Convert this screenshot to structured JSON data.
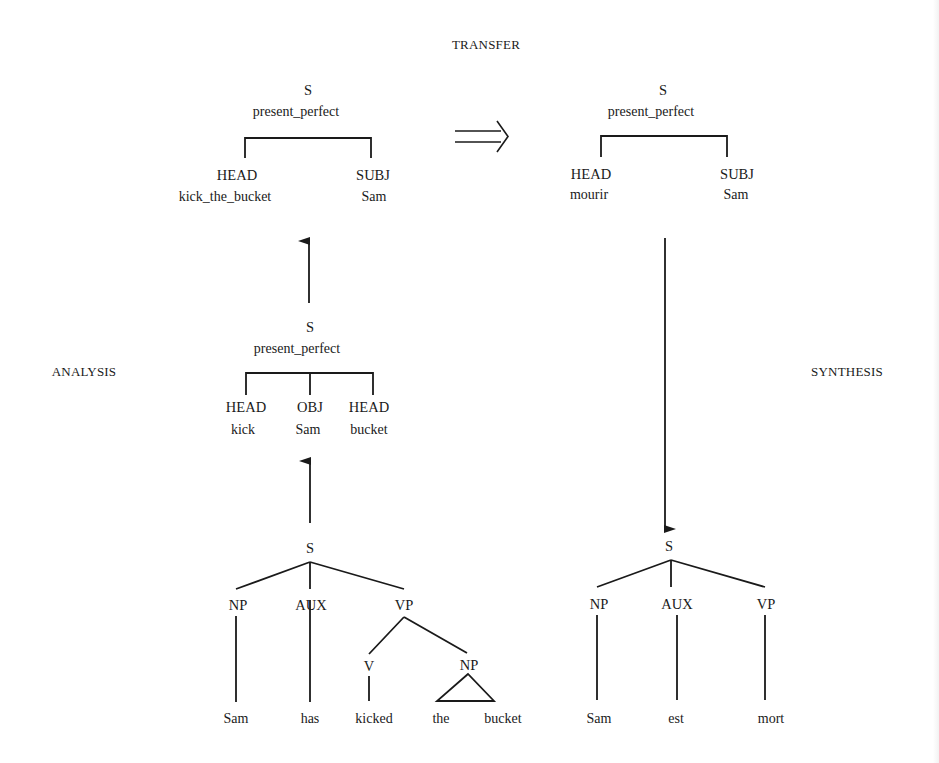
{
  "figure": {
    "stages": {
      "transfer": "TRANSFER",
      "analysis": "ANALYSIS",
      "synthesis": "SYNTHESIS"
    },
    "transfer_source": {
      "root": "S",
      "feature": "present_perfect",
      "children": [
        {
          "role": "HEAD",
          "value": "kick_the_bucket"
        },
        {
          "role": "SUBJ",
          "value": "Sam"
        }
      ]
    },
    "transfer_target": {
      "root": "S",
      "feature": "present_perfect",
      "children": [
        {
          "role": "HEAD",
          "value": "mourir"
        },
        {
          "role": "SUBJ",
          "value": "Sam"
        }
      ]
    },
    "analysis_intermediate": {
      "root": "S",
      "feature": "present_perfect",
      "children": [
        {
          "role": "HEAD",
          "value": "kick"
        },
        {
          "role": "OBJ",
          "value": "Sam"
        },
        {
          "role": "HEAD",
          "value": "bucket"
        }
      ]
    },
    "source_tree": {
      "root": "S",
      "np": "NP",
      "aux": "AUX",
      "vp": "VP",
      "v": "V",
      "obj_np": "NP",
      "words": [
        "Sam",
        "has",
        "kicked",
        "the",
        "bucket"
      ]
    },
    "target_tree": {
      "root": "S",
      "np": "NP",
      "aux": "AUX",
      "vp": "VP",
      "words": [
        "Sam",
        "est",
        "mort"
      ]
    },
    "arrows": {
      "transfer_arrow": "double-right-arrow",
      "analysis_arrows": "up-arrow",
      "synthesis_arrow": "down-arrow"
    }
  }
}
